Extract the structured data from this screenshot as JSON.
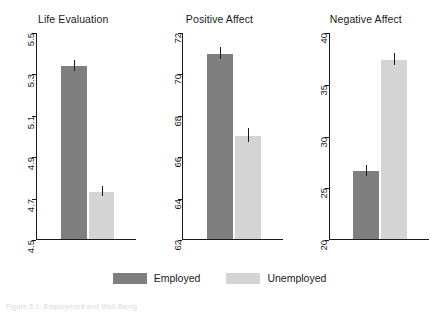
{
  "chart_data": {
    "type": "bar",
    "title": "",
    "categories": [
      "Employed",
      "Unemployed"
    ],
    "legend": {
      "position": "bottom",
      "entries": [
        {
          "name": "Employed",
          "color": "#7f7f7f"
        },
        {
          "name": "Unemployed",
          "color": "#d4d4d4"
        }
      ]
    },
    "grid": false,
    "panels": [
      {
        "title": "Life Evaluation",
        "ylim": [
          4.5,
          5.5
        ],
        "yticks": [
          "5.5",
          "5.3",
          "5.1",
          "4.9",
          "4.7",
          "4.5"
        ],
        "ytick_values": [
          5.5,
          5.3,
          5.1,
          4.9,
          4.7,
          4.5
        ],
        "values": [
          5.34,
          4.73
        ],
        "errors": [
          0.025,
          0.022
        ]
      },
      {
        "title": "Positive Affect",
        "ylim": [
          62,
          72
        ],
        "yticks": [
          "72",
          "70",
          "68",
          "66",
          "64",
          "62"
        ],
        "ytick_values": [
          72,
          70,
          68,
          66,
          64,
          62
        ],
        "values": [
          71.0,
          67.0
        ],
        "errors": [
          0.28,
          0.3
        ]
      },
      {
        "title": "Negative Affect",
        "ylim": [
          20,
          40
        ],
        "yticks": [
          "40",
          "35",
          "30",
          "25",
          "20"
        ],
        "ytick_values": [
          40,
          35,
          30,
          25,
          20
        ],
        "values": [
          26.6,
          37.4
        ],
        "errors": [
          0.45,
          0.5
        ]
      }
    ]
  },
  "caption": "Figure 5.1: Employment and Well-Being"
}
